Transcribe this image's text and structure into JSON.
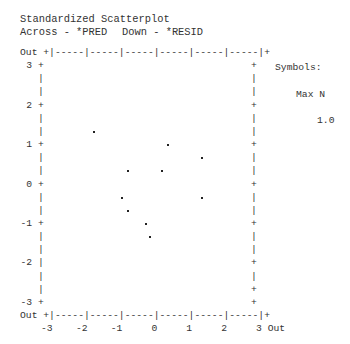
{
  "header": {
    "title": "Standardized Scatterplot",
    "across": "Across - *PRED",
    "down": "Down - *RESID"
  },
  "frame": {
    "top_border": "Out +|-----|-----|-----|-----|-----|-----|+",
    "bottom_border": "Out +|-----|-----|-----|-----|-----|-----|+",
    "x_tick_line": "-3    -2    -1     0     1     2     3 Out",
    "left_rows": [
      {
        "label": "3",
        "mark": "+"
      },
      {
        "label": "",
        "mark": "|"
      },
      {
        "label": "",
        "mark": "|"
      },
      {
        "label": "2",
        "mark": "+"
      },
      {
        "label": "",
        "mark": "|"
      },
      {
        "label": "",
        "mark": "|"
      },
      {
        "label": "1",
        "mark": "+"
      },
      {
        "label": "",
        "mark": "|"
      },
      {
        "label": "",
        "mark": "|"
      },
      {
        "label": "0",
        "mark": "+"
      },
      {
        "label": "",
        "mark": "|"
      },
      {
        "label": "",
        "mark": "|"
      },
      {
        "label": "-1",
        "mark": "+"
      },
      {
        "label": "",
        "mark": "|"
      },
      {
        "label": "",
        "mark": "|"
      },
      {
        "label": "-2",
        "mark": "|"
      },
      {
        "label": "",
        "mark": "|"
      },
      {
        "label": "",
        "mark": "|"
      },
      {
        "label": "-3",
        "mark": "+"
      }
    ],
    "right_rows": [
      "+",
      "|",
      "|",
      "+",
      "|",
      "|",
      "+",
      "|",
      "|",
      "+",
      "|",
      "|",
      "+",
      "|",
      "|",
      "+",
      "|",
      "+",
      "+"
    ]
  },
  "legend": {
    "title": "Symbols:",
    "header": "Max N",
    "value": "1.0"
  },
  "chart_data": {
    "type": "scatter",
    "title": "Standardized Scatterplot",
    "xlabel": "Across - *PRED",
    "ylabel": "Down - *RESID",
    "xlim": [
      -3,
      3
    ],
    "ylim": [
      -3,
      3
    ],
    "x_ticks": [
      "-3",
      "-2",
      "-1",
      "0",
      "1",
      "2",
      "3",
      "Out"
    ],
    "y_ticks": [
      "Out",
      "3",
      "2",
      "1",
      "0",
      "-1",
      "-2",
      "-3",
      "Out"
    ],
    "legend": {
      "title": "Symbols:",
      "header": "Max N",
      "entries": [
        "1.0"
      ]
    },
    "grid": false,
    "points": [
      {
        "x": -1.67,
        "y": 1.33
      },
      {
        "x": 0.46,
        "y": 1.0
      },
      {
        "x": 1.44,
        "y": 0.67
      },
      {
        "x": -0.69,
        "y": 0.33
      },
      {
        "x": 0.29,
        "y": 0.33
      },
      {
        "x": -0.86,
        "y": -0.33
      },
      {
        "x": 1.44,
        "y": -0.33
      },
      {
        "x": -0.69,
        "y": -0.67
      },
      {
        "x": -0.17,
        "y": -1.0
      },
      {
        "x": -0.06,
        "y": -1.33
      }
    ]
  }
}
